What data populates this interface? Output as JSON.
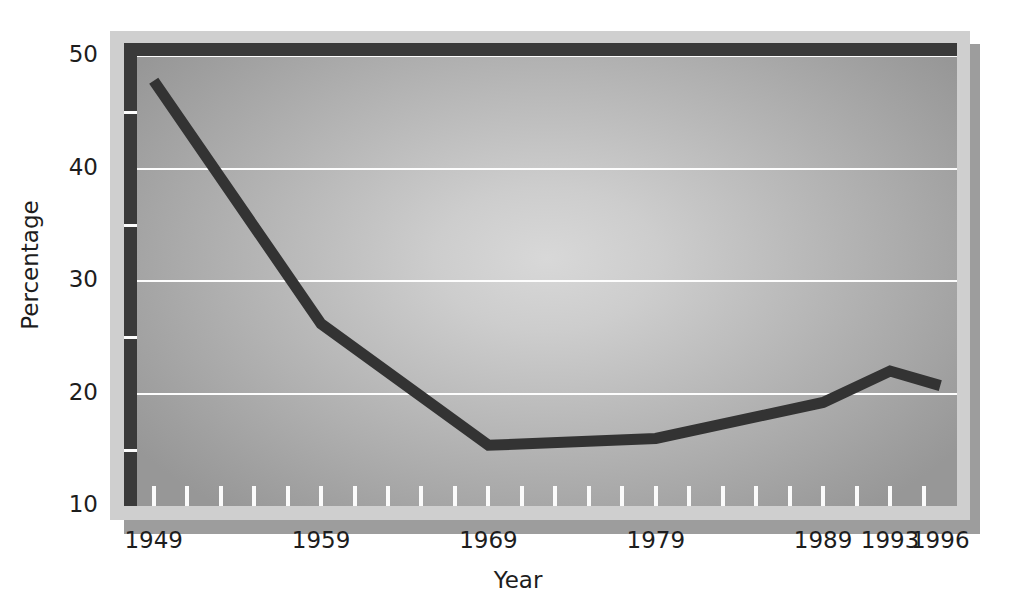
{
  "chart_data": {
    "type": "line",
    "title": "",
    "xlabel": "Year",
    "ylabel": "Percentage",
    "xlim": [
      1948,
      1997
    ],
    "ylim": [
      10,
      50
    ],
    "grid": true,
    "legend": false,
    "y_ticks": [
      10,
      20,
      30,
      40,
      50
    ],
    "y_minor_ticks": [
      15,
      25,
      35,
      45
    ],
    "x_tick_labels": [
      "1949",
      "1959",
      "1969",
      "1979",
      "1989",
      "1993",
      "1996"
    ],
    "x_labeled_years": [
      1949,
      1959,
      1969,
      1979,
      1989,
      1993,
      1996
    ],
    "x_minor_tick_years": [
      1949,
      1951,
      1953,
      1955,
      1957,
      1959,
      1961,
      1963,
      1965,
      1967,
      1969,
      1971,
      1973,
      1975,
      1977,
      1979,
      1981,
      1983,
      1985,
      1987,
      1989,
      1991,
      1993,
      1995
    ],
    "series": [
      {
        "name": "Percentage",
        "color": "#333333",
        "x": [
          1949,
          1959,
          1969,
          1979,
          1989,
          1993,
          1996
        ],
        "values": [
          47.8,
          26.2,
          15.4,
          16.0,
          19.2,
          22.0,
          20.7
        ]
      }
    ],
    "colors": {
      "line": "#333333",
      "gridline": "#fdfdfd",
      "axis_border": "#3a3a3a",
      "outer_frame": "#cfcfcf",
      "shadow": "#9d9d9d",
      "plot_center": "#d8d8d8",
      "plot_edge": "#979797",
      "text": "#1d1d1d",
      "page_background": "#ffffff"
    }
  }
}
